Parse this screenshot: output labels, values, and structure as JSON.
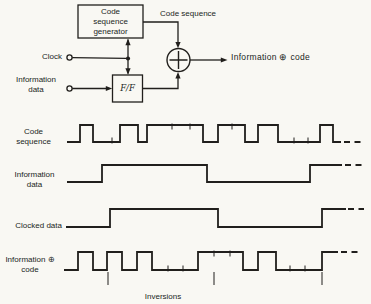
{
  "colors": {
    "ink": "#211f1c",
    "paper": "#f9f8f3"
  },
  "block_diagram": {
    "generator_box": {
      "lines": [
        "Code",
        "sequence",
        "generator"
      ]
    },
    "generator_output_label": "Code sequence",
    "clock_label": "Clock",
    "info_input_label_lines": [
      "Information",
      "data"
    ],
    "ff_box_label": "F/F",
    "xor_symbol": "+",
    "output_label": "Information ⊕ code"
  },
  "waveforms": [
    {
      "id": "code-sequence",
      "label_lines": [
        "Code",
        "sequence"
      ],
      "y_high": 125,
      "y_low": 142,
      "x_start": 67,
      "start_level": "low",
      "edges": [
        80,
        93,
        120,
        138,
        147,
        203,
        218,
        245,
        258,
        278,
        320,
        333
      ],
      "x_end": 341,
      "ticks_up": [
        112,
        294,
        308
      ],
      "ticks_down": [
        172,
        190,
        232
      ],
      "dash_from": 344,
      "dash_to": 362,
      "dash_level": "low"
    },
    {
      "id": "information-data",
      "label_lines": [
        "Information",
        "data"
      ],
      "y_high": 165,
      "y_low": 182,
      "x_start": 67,
      "start_level": "low",
      "edges": [
        102,
        207,
        310
      ],
      "x_end": 342,
      "ticks_up": [],
      "ticks_down": [],
      "dash_from": 345,
      "dash_to": 362,
      "dash_level": "high"
    },
    {
      "id": "clocked-data",
      "label_lines": [
        "Clocked data"
      ],
      "y_high": 209,
      "y_low": 227,
      "x_start": 66,
      "start_level": "low",
      "edges": [
        110,
        218,
        322
      ],
      "x_end": 346,
      "ticks_up": [],
      "ticks_down": [],
      "dash_from": 348,
      "dash_to": 364,
      "dash_level": "high"
    },
    {
      "id": "information-xor-code",
      "label_lines": [
        "Information ⊕",
        "code"
      ],
      "y_high": 252,
      "y_low": 270,
      "x_start": 64,
      "start_level": "low",
      "edges": [
        78,
        93,
        107,
        122,
        137,
        152,
        198,
        243,
        258,
        276,
        322
      ],
      "x_end": 338,
      "ticks_up": [
        168,
        183,
        290,
        305
      ],
      "ticks_down": [
        214,
        230
      ],
      "dash_from": 341,
      "dash_to": 358,
      "dash_level": "high"
    }
  ],
  "inversions": {
    "label": "Inversions",
    "tick_xs": [
      108,
      214,
      322
    ],
    "y_top": 272,
    "y_bottom": 285
  }
}
